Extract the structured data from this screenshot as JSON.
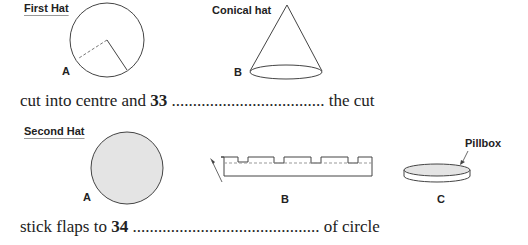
{
  "first_hat": {
    "title": "First Hat",
    "label_a": "A",
    "cone_title": "Conical hat",
    "label_b": "B"
  },
  "sentence_1": {
    "before": "cut into centre and ",
    "number": "33",
    "dots": " ....................................",
    "after": " the cut"
  },
  "second_hat": {
    "title": "Second Hat",
    "label_a": "A",
    "label_b": "B",
    "label_c": "C",
    "pillbox_label": "Pillbox"
  },
  "sentence_2": {
    "before": "stick flaps to ",
    "number": "34",
    "dots": " ............................................",
    "after": " of circle"
  },
  "colors": {
    "line": "#444444",
    "fill": "#e4e4e4",
    "dashed": "#777777"
  }
}
